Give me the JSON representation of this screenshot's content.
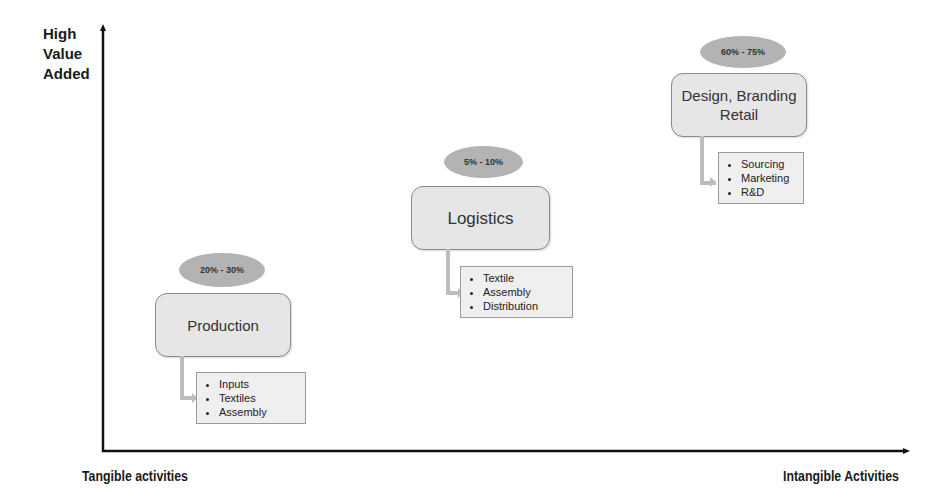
{
  "axes": {
    "y_label": [
      "High",
      "Value",
      "Added"
    ],
    "x_left_label": "Tangible activities",
    "x_right_label": "Intangible Activities"
  },
  "stages": [
    {
      "name": "Production",
      "range": "20% - 30%",
      "items": [
        "Inputs",
        "Textiles",
        "Assembly"
      ]
    },
    {
      "name": "Logistics",
      "range": "5% - 10%",
      "items": [
        "Textile",
        "Assembly",
        "Distribution"
      ]
    },
    {
      "name_lines": [
        "Design, Branding",
        "Retail"
      ],
      "range": "60% - 75%",
      "items": [
        "Sourcing",
        "Marketing",
        "R&D"
      ]
    }
  ],
  "colors": {
    "oval": "#b3b3b3",
    "box": "#e6e6e6",
    "axis": "#111111"
  }
}
